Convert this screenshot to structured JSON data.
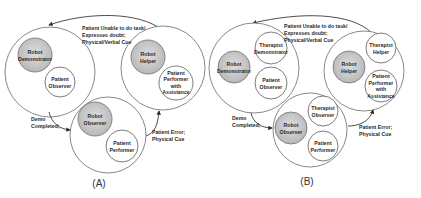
{
  "colors": {
    "robot_fill": "#c4c4c4",
    "robot_fill_light": "#dedede",
    "outline": "#7a7a7a",
    "text": "#2a2a2a"
  },
  "panels": [
    {
      "caption": "(A)",
      "states": [
        {
          "name": "demonstration",
          "nodes": [
            {
              "lines": [
                "Robot",
                "Demonstrator"
              ],
              "role": "robot"
            },
            {
              "lines": [
                "Patient",
                "Observer"
              ],
              "role": "patient"
            }
          ]
        },
        {
          "name": "helping",
          "nodes": [
            {
              "lines": [
                "Robot",
                "Helper"
              ],
              "role": "robot"
            },
            {
              "lines": [
                "Patient",
                "Performer",
                "with",
                "Assistance"
              ],
              "role": "patient"
            }
          ]
        },
        {
          "name": "observing",
          "nodes": [
            {
              "lines": [
                "Robot",
                "Observer"
              ],
              "role": "robot"
            },
            {
              "lines": [
                "Patient",
                "Performer"
              ],
              "role": "patient"
            }
          ]
        }
      ],
      "edges": [
        {
          "from": "helping",
          "to": "demonstration",
          "lines": [
            "Patient  Unable to do task/",
            "Expresses doubt;",
            "Physical/Verbal Cue"
          ]
        },
        {
          "from": "demonstration",
          "to": "observing",
          "lines": [
            "Demo",
            "Completed;"
          ]
        },
        {
          "from": "observing",
          "to": "helping",
          "lines": [
            "Patient Error;",
            "Physical Cue"
          ]
        }
      ]
    },
    {
      "caption": "(B)",
      "states": [
        {
          "name": "demonstration",
          "nodes": [
            {
              "lines": [
                "Therapist",
                "Demonstrator"
              ],
              "role": "therapist"
            },
            {
              "lines": [
                "Robot",
                "Demonstrator"
              ],
              "role": "robot"
            },
            {
              "lines": [
                "Patient",
                "Observer"
              ],
              "role": "patient"
            }
          ]
        },
        {
          "name": "helping",
          "nodes": [
            {
              "lines": [
                "Therapist",
                "Helper"
              ],
              "role": "therapist"
            },
            {
              "lines": [
                "Robot",
                "Helper"
              ],
              "role": "robot"
            },
            {
              "lines": [
                "Patient",
                "Performer",
                "with",
                "Assistance"
              ],
              "role": "patient"
            }
          ]
        },
        {
          "name": "observing",
          "nodes": [
            {
              "lines": [
                "Therapist",
                "Observer"
              ],
              "role": "therapist"
            },
            {
              "lines": [
                "Robot",
                "Observer"
              ],
              "role": "robot"
            },
            {
              "lines": [
                "Patient",
                "Performer"
              ],
              "role": "patient"
            }
          ]
        }
      ],
      "edges": [
        {
          "from": "helping",
          "to": "demonstration",
          "lines": [
            "Patient  Unable to do task/",
            "Expresses doubt;",
            "Physical/Verbal Cue"
          ]
        },
        {
          "from": "demonstration",
          "to": "observing",
          "lines": [
            "Demo",
            "Completed;"
          ]
        },
        {
          "from": "observing",
          "to": "helping",
          "lines": [
            "Patient Error;",
            "Physical Cue"
          ]
        }
      ]
    }
  ]
}
